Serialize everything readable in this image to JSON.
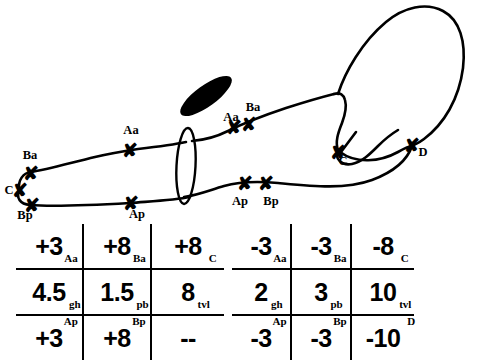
{
  "figure": {
    "type": "knot-diagram-with-tables",
    "diagram": {
      "crossing_labels": [
        {
          "id": "Ba-left",
          "text": "Ba",
          "x": 30,
          "y": 155
        },
        {
          "id": "C-left",
          "text": "C",
          "x": 9,
          "y": 190
        },
        {
          "id": "Bp-left",
          "text": "Bp",
          "x": 25,
          "y": 215
        },
        {
          "id": "Aa-mid",
          "text": "Aa",
          "x": 131,
          "y": 130
        },
        {
          "id": "Ap-mid",
          "text": "Ap",
          "x": 137,
          "y": 213
        },
        {
          "id": "Aa-upper",
          "text": "Aa",
          "x": 231,
          "y": 117
        },
        {
          "id": "Ba-upper",
          "text": "Ba",
          "x": 253,
          "y": 107
        },
        {
          "id": "Ap-lower",
          "text": "Ap",
          "x": 240,
          "y": 200
        },
        {
          "id": "Bp-lower",
          "text": "Bp",
          "x": 271,
          "y": 200
        },
        {
          "id": "C-right",
          "text": "C",
          "x": 343,
          "y": 160
        },
        {
          "id": "D-right",
          "text": "D",
          "x": 423,
          "y": 152
        }
      ],
      "crossing_marks": [
        {
          "id": "x-Ba-left",
          "x": 31,
          "y": 173
        },
        {
          "id": "x-C-left",
          "x": 20,
          "y": 190
        },
        {
          "id": "x-Bp-left",
          "x": 32,
          "y": 205
        },
        {
          "id": "x-Aa-mid",
          "x": 130,
          "y": 150
        },
        {
          "id": "x-Ap-mid",
          "x": 131,
          "y": 203
        },
        {
          "id": "x-Aa-upper",
          "x": 234,
          "y": 127
        },
        {
          "id": "x-Ba-upper",
          "x": 249,
          "y": 124
        },
        {
          "id": "x-Ap-lower",
          "x": 245,
          "y": 183
        },
        {
          "id": "x-Bp-lower",
          "x": 266,
          "y": 183
        },
        {
          "id": "x-C-right",
          "x": 338,
          "y": 152
        },
        {
          "id": "x-D-right",
          "x": 412,
          "y": 145
        }
      ]
    },
    "tables": {
      "left": {
        "name": "left-invariant-table",
        "rows": [
          [
            {
              "value": "+3",
              "sub": "Aa",
              "subpos": "br"
            },
            {
              "value": "+8",
              "sub": "Ba",
              "subpos": "br"
            },
            {
              "value": "+8",
              "sub": "C",
              "subpos": "br"
            }
          ],
          [
            {
              "value": "4.5",
              "sub": "gh",
              "subpos": "br"
            },
            {
              "value": "1.5",
              "sub": "pb",
              "subpos": "br"
            },
            {
              "value": "8",
              "sub": "tvl",
              "subpos": "br"
            }
          ],
          [
            {
              "value": "+3",
              "sub": "Ap",
              "subpos": "tr"
            },
            {
              "value": "+8",
              "sub": "Bp",
              "subpos": "tr"
            },
            {
              "value": "--",
              "sub": "",
              "subpos": "tr"
            }
          ]
        ]
      },
      "right": {
        "name": "right-invariant-table",
        "rows": [
          [
            {
              "value": "-3",
              "sub": "Aa",
              "subpos": "br"
            },
            {
              "value": "-3",
              "sub": "Ba",
              "subpos": "br"
            },
            {
              "value": "-8",
              "sub": "C",
              "subpos": "br"
            }
          ],
          [
            {
              "value": "2",
              "sub": "gh",
              "subpos": "br"
            },
            {
              "value": "3",
              "sub": "pb",
              "subpos": "br"
            },
            {
              "value": "10",
              "sub": "tvl",
              "subpos": "br"
            }
          ],
          [
            {
              "value": "-3",
              "sub": "Ap",
              "subpos": "tr"
            },
            {
              "value": "-3",
              "sub": "Bp",
              "subpos": "tr"
            },
            {
              "value": "-10",
              "sub": "D",
              "subpos": "tr"
            }
          ]
        ]
      }
    },
    "colors": {
      "ink": "#000000",
      "paper": "#ffffff"
    }
  }
}
